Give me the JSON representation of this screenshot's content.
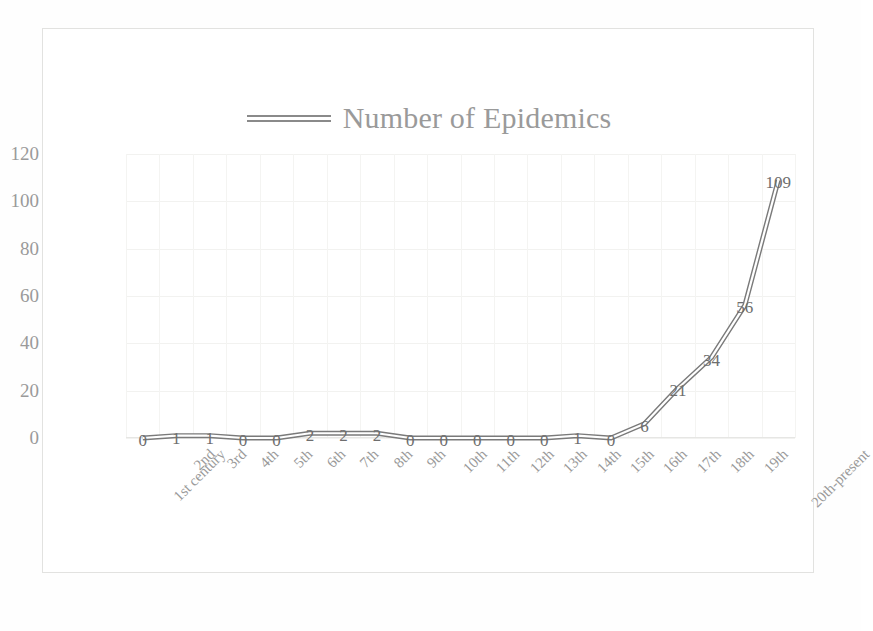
{
  "chart_data": {
    "type": "line",
    "title": "",
    "legend_label": "Number of Epidemics",
    "legend_position": "top-center",
    "xlabel": "",
    "ylabel": "",
    "ylim": [
      0,
      120
    ],
    "yticks": [
      0,
      20,
      40,
      60,
      80,
      100,
      120
    ],
    "grid": true,
    "categories": [
      "1st century",
      "2nd",
      "3rd",
      "4th",
      "5th",
      "6th",
      "7th",
      "8th",
      "9th",
      "10th",
      "11th",
      "12th",
      "13th",
      "14th",
      "15th",
      "16th",
      "17th",
      "18th",
      "19th",
      "20th-present"
    ],
    "values": [
      0,
      1,
      1,
      0,
      0,
      2,
      2,
      2,
      0,
      0,
      0,
      0,
      0,
      1,
      0,
      6,
      21,
      34,
      56,
      109
    ],
    "data_labels": [
      "0",
      "1",
      "1",
      "0",
      "0",
      "2",
      "2",
      "2",
      "0",
      "0",
      "0",
      "0",
      "0",
      "1",
      "0",
      "6",
      "21",
      "34",
      "56",
      "109"
    ],
    "series": [
      {
        "name": "Number of Epidemics",
        "values": [
          0,
          1,
          1,
          0,
          0,
          2,
          2,
          2,
          0,
          0,
          0,
          0,
          0,
          1,
          0,
          6,
          21,
          34,
          56,
          109
        ]
      }
    ],
    "colors": {
      "line": "#7a7a7a",
      "grid": "#f2f2f0",
      "tick_text": "#9a9a9a",
      "label_text": "#6e6e6e",
      "frame": "#e2e2e0",
      "background": "#ffffff"
    }
  }
}
